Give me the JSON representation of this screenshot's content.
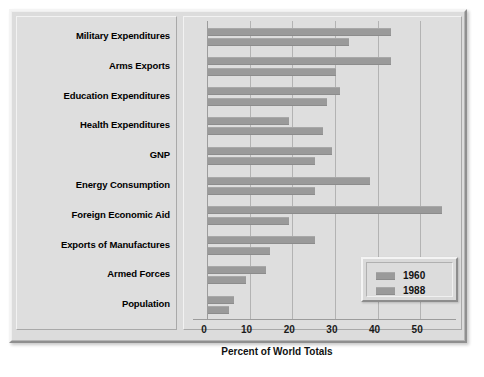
{
  "chart_data": {
    "type": "bar",
    "orientation": "horizontal",
    "title": "",
    "xlabel": "Percent of World Totals",
    "ylabel": "",
    "xlim": [
      0,
      57
    ],
    "xticks": [
      0,
      10,
      20,
      30,
      40,
      50
    ],
    "xtick_labels": [
      "0",
      "10",
      "20",
      "30",
      "40",
      "50"
    ],
    "grid": "vertical",
    "legend_position": "lower-right",
    "categories": [
      "Military Expenditures",
      "Arms Exports",
      "Education Expenditures",
      "Health Expenditures",
      "GNP",
      "Energy Consumption",
      "Foreign Economic Aid",
      "Exports of Manufactures",
      "Armed Forces",
      "Population"
    ],
    "series": [
      {
        "name": "1960",
        "color": "#9a9a9a",
        "values": [
          43,
          43,
          31,
          19,
          29,
          38,
          55,
          25,
          13.5,
          6
        ]
      },
      {
        "name": "1988",
        "color": "#9a9a9a",
        "values": [
          33,
          30,
          28,
          27,
          25,
          25,
          19,
          14.5,
          9,
          5
        ]
      }
    ]
  },
  "legend": {
    "entries": [
      {
        "label": "1960"
      },
      {
        "label": "1988"
      }
    ]
  },
  "colors": {
    "bar": "#9a9a9a",
    "panel": "#dedede",
    "frame": "#d6d6d6",
    "gridline": "#b3b3b3",
    "axis": "#9c9c9c",
    "text": "#111111"
  }
}
